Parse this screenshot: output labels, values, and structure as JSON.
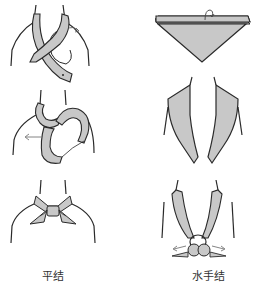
{
  "figure": {
    "colors": {
      "scarf_fill": "#c8c8c8",
      "stroke": "#2a2a2a",
      "background": "#ffffff"
    },
    "left_column": {
      "steps": [
        {
          "name": "flat-knot-step-1",
          "description": "scarf ends crossed around neck"
        },
        {
          "name": "flat-knot-step-2",
          "description": "end looped through with pull arrow"
        },
        {
          "name": "flat-knot-step-3",
          "description": "finished flat knot"
        }
      ],
      "caption": "平结"
    },
    "right_column": {
      "steps": [
        {
          "name": "sailor-knot-step-1",
          "description": "triangle scarf folded"
        },
        {
          "name": "sailor-knot-step-2",
          "description": "scarf draped around collar"
        },
        {
          "name": "sailor-knot-step-3",
          "description": "finished sailor knot with arrows"
        }
      ],
      "caption": "水手结"
    }
  }
}
